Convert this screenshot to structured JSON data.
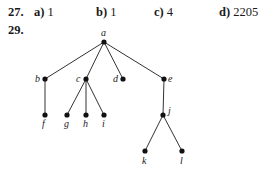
{
  "problem27": {
    "number": "27.",
    "answers": [
      {
        "label": "a)",
        "value": "1"
      },
      {
        "label": "b)",
        "value": "1"
      },
      {
        "label": "c)",
        "value": "4"
      },
      {
        "label": "d)",
        "value": "2205"
      }
    ]
  },
  "problem29": {
    "number": "29.",
    "tree": {
      "nodes": [
        {
          "id": "a",
          "label": "a"
        },
        {
          "id": "b",
          "label": "b"
        },
        {
          "id": "c",
          "label": "c"
        },
        {
          "id": "d",
          "label": "d"
        },
        {
          "id": "e",
          "label": "e"
        },
        {
          "id": "f",
          "label": "f"
        },
        {
          "id": "g",
          "label": "g"
        },
        {
          "id": "h",
          "label": "h"
        },
        {
          "id": "i",
          "label": "i"
        },
        {
          "id": "j",
          "label": "j"
        },
        {
          "id": "k",
          "label": "k"
        },
        {
          "id": "l",
          "label": "l"
        }
      ],
      "edges": [
        [
          "a",
          "b"
        ],
        [
          "a",
          "c"
        ],
        [
          "a",
          "d"
        ],
        [
          "a",
          "e"
        ],
        [
          "b",
          "f"
        ],
        [
          "c",
          "g"
        ],
        [
          "c",
          "h"
        ],
        [
          "c",
          "i"
        ],
        [
          "e",
          "j"
        ],
        [
          "j",
          "k"
        ],
        [
          "j",
          "l"
        ]
      ]
    }
  }
}
